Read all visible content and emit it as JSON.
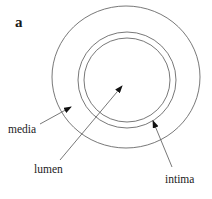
{
  "figure": {
    "panel_label": "a",
    "labels": {
      "media": "media",
      "lumen": "lumen",
      "intima": "intima"
    },
    "colors": {
      "line": "#555555",
      "text": "#222222",
      "background": "#ffffff"
    }
  }
}
